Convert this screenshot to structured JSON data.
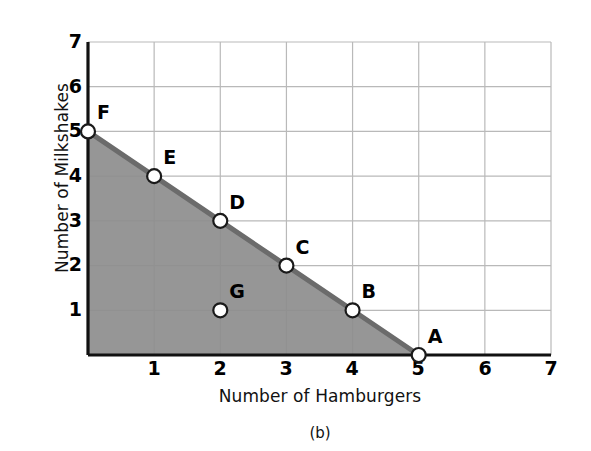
{
  "figure": {
    "caption": "(b)",
    "xlabel": "Number of Hamburgers",
    "ylabel": "Number of Milkshakes"
  },
  "colors": {
    "shaded_region": "#8d8d8d",
    "frontier_line": "#6b6b6b",
    "gridline": "#b9b9b9",
    "axis": "#111111",
    "marker_fill": "#ffffff",
    "marker_stroke": "#1a1a1a",
    "text": "#000000",
    "background": "#ffffff"
  },
  "chart_data": {
    "type": "line",
    "title": "",
    "subtitle": "",
    "xlabel": "Number of Hamburgers",
    "ylabel": "Number of Milkshakes",
    "xlim": [
      0,
      7
    ],
    "ylim": [
      0,
      7
    ],
    "xticks": [
      1,
      2,
      3,
      4,
      5,
      6,
      7
    ],
    "yticks": [
      1,
      2,
      3,
      4,
      5,
      6,
      7
    ],
    "xtick_labels": [
      "1",
      "2",
      "3",
      "4",
      "5",
      "6",
      "7"
    ],
    "ytick_labels": [
      "1",
      "2",
      "3",
      "4",
      "5",
      "6",
      "7"
    ],
    "grid": true,
    "legend": false,
    "legend_position": "none",
    "annotations": [
      "(b)"
    ],
    "series": [
      {
        "name": "Production Possibility Frontier",
        "x": [
          0,
          1,
          2,
          3,
          4,
          5
        ],
        "y": [
          5,
          4,
          3,
          2,
          1,
          0
        ],
        "point_labels": [
          "F",
          "E",
          "D",
          "C",
          "B",
          "A"
        ],
        "shaded_below": true
      },
      {
        "name": "Interior point",
        "x": [
          2
        ],
        "y": [
          1
        ],
        "point_labels": [
          "G"
        ],
        "shaded_below": false
      }
    ],
    "points": [
      {
        "label": "F",
        "x": 0,
        "y": 5
      },
      {
        "label": "E",
        "x": 1,
        "y": 4
      },
      {
        "label": "D",
        "x": 2,
        "y": 3
      },
      {
        "label": "C",
        "x": 3,
        "y": 2
      },
      {
        "label": "B",
        "x": 4,
        "y": 1
      },
      {
        "label": "A",
        "x": 5,
        "y": 0
      },
      {
        "label": "G",
        "x": 2,
        "y": 1
      }
    ]
  }
}
